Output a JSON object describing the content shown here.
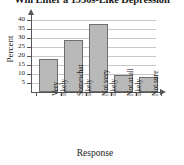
{
  "chart_data": {
    "type": "bar",
    "title": "Will Enter a 1930s-Like Depression",
    "xlabel": "Response",
    "ylabel": "Percent",
    "categories": [
      "Very likely",
      "Somewhat likely",
      "Not very likely",
      "Not at all likely",
      "Not sure"
    ],
    "category_lines": [
      [
        "Very",
        "likely"
      ],
      [
        "Somewhat",
        "likely"
      ],
      [
        "Not very",
        "likely"
      ],
      [
        "Not at all",
        "likely"
      ],
      [
        "Not sure",
        ""
      ]
    ],
    "values": [
      18,
      29,
      37.5,
      9.3,
      8.5
    ],
    "ylim": [
      0,
      42
    ],
    "yticks": [
      5,
      10,
      15,
      20,
      25,
      30,
      35,
      40
    ],
    "ytick_labels": [
      "5",
      "10",
      "15",
      "20",
      "25",
      "30",
      "35",
      "40"
    ],
    "grid": true,
    "legend": "none",
    "bar_fill": "#b9b9b9",
    "bar_border": "#6e6e6e",
    "axis_color": "#555555",
    "grid_color": "#c8c8c8"
  }
}
